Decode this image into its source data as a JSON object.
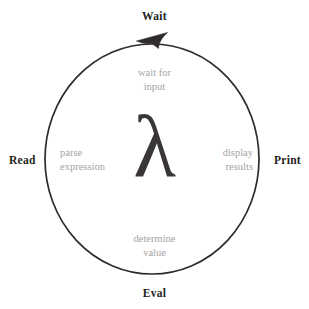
{
  "diagram": {
    "title_glyph": "λ",
    "type": "read-eval-print-wait cycle",
    "colors": {
      "background": "#ffffff",
      "stroke": "#2f2b2c",
      "stage_label": "#231f20",
      "action_text": "#a6a3a3",
      "lambda": "#3a3637"
    },
    "geometry": {
      "center_x": 152,
      "center_y": 159,
      "radius_x": 107,
      "radius_y": 115,
      "stroke_width": 1.7,
      "direction": "counterclockwise"
    },
    "stages": [
      {
        "name": "wait",
        "label": "Wait",
        "position": "top",
        "action_lines": [
          "wait for",
          "input"
        ]
      },
      {
        "name": "read",
        "label": "Read",
        "position": "left",
        "action_lines": [
          "parse",
          "expression"
        ]
      },
      {
        "name": "eval",
        "label": "Eval",
        "position": "bottom",
        "action_lines": [
          "determine",
          "value"
        ]
      },
      {
        "name": "print",
        "label": "Print",
        "position": "right",
        "action_lines": [
          "display",
          "results"
        ]
      }
    ],
    "arrow": {
      "name": "cycle-direction-arrowhead",
      "location": "top of ellipse",
      "points": "left"
    }
  }
}
